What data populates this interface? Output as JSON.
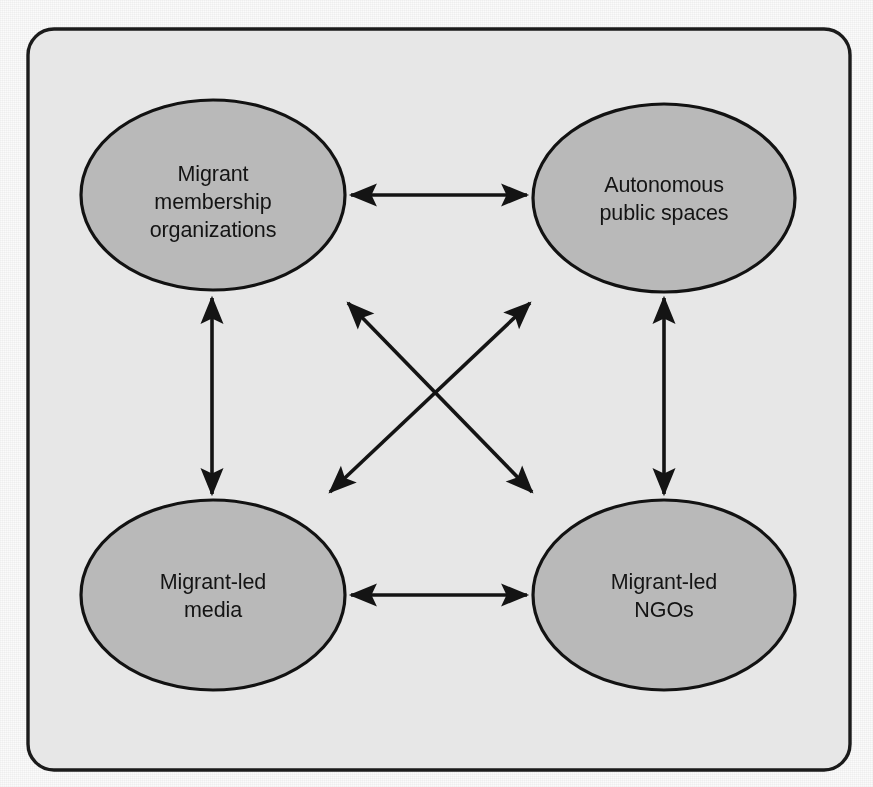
{
  "figure": {
    "frame": {
      "shape": "rounded-rectangle",
      "stroke_color": "#1b1b1b",
      "fill_color": "#e7e7e7",
      "corner_radius": 26
    },
    "page_background": "#fbfbfb",
    "node_fill_color": "#b9b9b9",
    "node_stroke_color": "#121212",
    "arrow_color": "#141414"
  },
  "nodes": [
    {
      "id": "migrant-membership-organizations",
      "lines": [
        "Migrant",
        "membership",
        "organizations"
      ],
      "position": "top-left",
      "cx": 213,
      "cy": 195,
      "rx": 132,
      "ry": 95
    },
    {
      "id": "autonomous-public-spaces",
      "lines": [
        "Autonomous",
        "public spaces"
      ],
      "position": "top-right",
      "cx": 664,
      "cy": 198,
      "rx": 131,
      "ry": 94
    },
    {
      "id": "migrant-led-media",
      "lines": [
        "Migrant-led",
        "media"
      ],
      "position": "bottom-left",
      "cx": 213,
      "cy": 595,
      "rx": 132,
      "ry": 95
    },
    {
      "id": "migrant-led-ngos",
      "lines": [
        "Migrant-led",
        "NGOs"
      ],
      "position": "bottom-right",
      "cx": 664,
      "cy": 595,
      "rx": 131,
      "ry": 95
    }
  ],
  "connectors": [
    {
      "id": "top-horizontal",
      "from": "migrant-membership-organizations",
      "to": "autonomous-public-spaces",
      "direction": "bidirectional",
      "orientation": "horizontal"
    },
    {
      "id": "left-vertical",
      "from": "migrant-membership-organizations",
      "to": "migrant-led-media",
      "direction": "bidirectional",
      "orientation": "vertical"
    },
    {
      "id": "right-vertical",
      "from": "autonomous-public-spaces",
      "to": "migrant-led-ngos",
      "direction": "bidirectional",
      "orientation": "vertical"
    },
    {
      "id": "bottom-horizontal",
      "from": "migrant-led-media",
      "to": "migrant-led-ngos",
      "direction": "bidirectional",
      "orientation": "horizontal"
    },
    {
      "id": "diagonal-mmo-ngos",
      "from": "migrant-membership-organizations",
      "to": "migrant-led-ngos",
      "direction": "bidirectional",
      "orientation": "diagonal-down-right"
    },
    {
      "id": "diagonal-media-aps",
      "from": "migrant-led-media",
      "to": "autonomous-public-spaces",
      "direction": "bidirectional",
      "orientation": "diagonal-up-right"
    }
  ]
}
